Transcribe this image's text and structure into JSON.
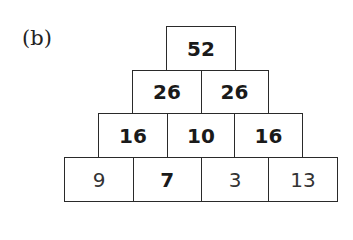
{
  "label": "(b)",
  "pyramid": {
    "rows": [
      [
        {
          "value": "52",
          "bold": true
        }
      ],
      [
        {
          "value": "26",
          "bold": true
        },
        {
          "value": "26",
          "bold": true
        }
      ],
      [
        {
          "value": "16",
          "bold": true
        },
        {
          "value": "10",
          "bold": true
        },
        {
          "value": "16",
          "bold": true
        }
      ],
      [
        {
          "value": "9",
          "bold": false
        },
        {
          "value": "7",
          "bold": true
        },
        {
          "value": "3",
          "bold": false
        },
        {
          "value": "13",
          "bold": false
        }
      ]
    ]
  }
}
